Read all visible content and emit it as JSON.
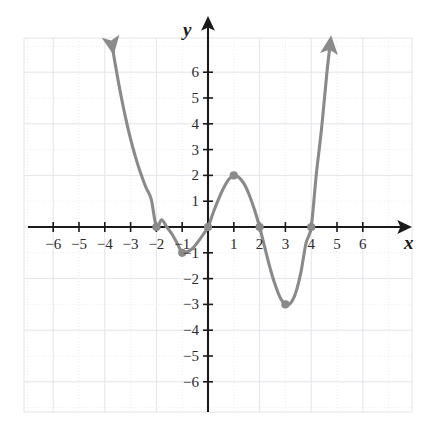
{
  "figure": {
    "kind": "cartesian-coordinate-plane-graph",
    "axis_labels": {
      "x": "x",
      "y": "y"
    },
    "colors": {
      "curve": "#8a8a8a",
      "axis": "#1a1a1a",
      "grid_minor": "#ededf2",
      "grid_major": "#e3e3ea",
      "point": "#8a8a8a",
      "background": "#ffffff",
      "tick_text": "#2b2b2b"
    },
    "geometry": {
      "origin_px": {
        "x": 208,
        "y": 227
      },
      "unit_px": 25.8,
      "grid_rect_px": {
        "left": 24,
        "top": 38,
        "right": 412,
        "bottom": 412
      }
    }
  },
  "chart_data": {
    "type": "line",
    "title": "",
    "xlabel": "x",
    "ylabel": "y",
    "xlim": [
      -7.1,
      7.9
    ],
    "ylim": [
      -7.4,
      7.3
    ],
    "xticks": [
      -6,
      -5,
      -4,
      -3,
      -2,
      -1,
      1,
      2,
      3,
      4,
      5,
      6
    ],
    "yticks": [
      6,
      5,
      4,
      3,
      2,
      1,
      -1,
      -2,
      -3,
      -4,
      -5,
      -6
    ],
    "xtick_labels": [
      "−6",
      "−5",
      "−4",
      "−3",
      "−2",
      "−1",
      "1",
      "2",
      "3",
      "4",
      "5",
      "6"
    ],
    "ytick_labels": [
      "6",
      "5",
      "4",
      "3",
      "2",
      "1",
      "−1",
      "−2",
      "−3",
      "−4",
      "−5",
      "−6"
    ],
    "grid": true,
    "legend": "none",
    "series": [
      {
        "name": "quartic curve",
        "style": "solid",
        "arrow_start": true,
        "arrow_end": true,
        "x_domain": [
          -3.72,
          4.73
        ],
        "points": [
          [
            -3.72,
            7.05
          ],
          [
            -3.6,
            6.34
          ],
          [
            -3.4,
            5.23
          ],
          [
            -3.2,
            4.26
          ],
          [
            -3.0,
            3.41
          ],
          [
            -2.8,
            2.68
          ],
          [
            -2.6,
            2.05
          ],
          [
            -2.4,
            1.52
          ],
          [
            -2.2,
            1.07
          ],
          [
            -2.0,
            0.0
          ],
          [
            -1.8,
            0.28
          ],
          [
            -1.6,
            0.0
          ],
          [
            -1.4,
            -0.27
          ],
          [
            -1.2,
            -0.62
          ],
          [
            -1.0,
            -1.0
          ],
          [
            -0.8,
            -0.96
          ],
          [
            -0.6,
            -0.83
          ],
          [
            -0.4,
            -0.59
          ],
          [
            -0.2,
            -0.31
          ],
          [
            0.0,
            0.0
          ],
          [
            0.2,
            0.55
          ],
          [
            0.4,
            1.06
          ],
          [
            0.6,
            1.5
          ],
          [
            0.8,
            1.84
          ],
          [
            1.0,
            2.0
          ],
          [
            1.2,
            1.92
          ],
          [
            1.4,
            1.67
          ],
          [
            1.6,
            1.24
          ],
          [
            1.8,
            0.68
          ],
          [
            2.0,
            0.0
          ],
          [
            2.2,
            -0.79
          ],
          [
            2.4,
            -1.57
          ],
          [
            2.6,
            -2.23
          ],
          [
            2.8,
            -2.74
          ],
          [
            3.0,
            -3.0
          ],
          [
            3.2,
            -2.95
          ],
          [
            3.4,
            -2.55
          ],
          [
            3.6,
            -1.76
          ],
          [
            3.8,
            -0.62
          ],
          [
            4.0,
            0.0
          ],
          [
            4.2,
            2.06
          ],
          [
            4.4,
            3.8
          ],
          [
            4.6,
            5.9
          ],
          [
            4.73,
            7.05
          ]
        ]
      }
    ],
    "marked_points": [
      {
        "label": "x-intercept",
        "x": -2,
        "y": 0
      },
      {
        "label": "local minimum",
        "x": -1,
        "y": -1
      },
      {
        "label": "x-intercept / y-intercept",
        "x": 0,
        "y": 0
      },
      {
        "label": "local maximum",
        "x": 1,
        "y": 2
      },
      {
        "label": "x-intercept",
        "x": 2,
        "y": 0
      },
      {
        "label": "local minimum",
        "x": 3,
        "y": -3
      },
      {
        "label": "x-intercept",
        "x": 4,
        "y": 0
      }
    ]
  }
}
